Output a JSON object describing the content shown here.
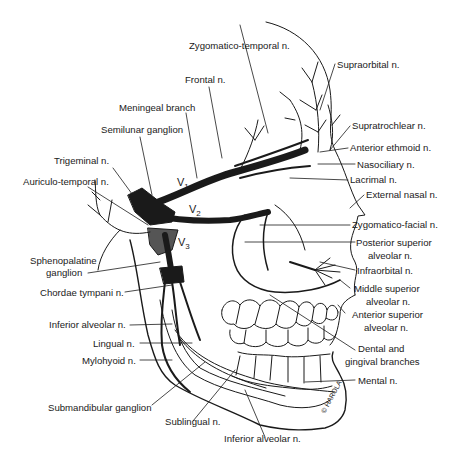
{
  "diagram": {
    "labels_left": [
      {
        "id": "zygomatico-temporal",
        "text": "Zygomatico-temporal n."
      },
      {
        "id": "frontal",
        "text": "Frontal n."
      },
      {
        "id": "meningeal",
        "text": "Meningeal branch"
      },
      {
        "id": "semilunar",
        "text": "Semilunar ganglion"
      },
      {
        "id": "trigeminal",
        "text": "Trigeminal n."
      },
      {
        "id": "auriculo-temporal",
        "text": "Auriculo-temporal n."
      },
      {
        "id": "sphenopalatine-1",
        "text": "Sphenopalatine"
      },
      {
        "id": "sphenopalatine-2",
        "text": "ganglion"
      },
      {
        "id": "chordae-tympani",
        "text": "Chordae tympani n."
      },
      {
        "id": "inferior-alveolar-left",
        "text": "Inferior alveolar n."
      },
      {
        "id": "lingual",
        "text": "Lingual n."
      },
      {
        "id": "mylohyoid",
        "text": "Mylohyoid n."
      },
      {
        "id": "submandibular",
        "text": "Submandibular ganglion"
      },
      {
        "id": "sublingual",
        "text": "Sublingual n."
      },
      {
        "id": "inferior-alveolar-bottom",
        "text": "Inferior alveolar n."
      }
    ],
    "labels_right": [
      {
        "id": "supraorbital",
        "text": "Supraorbital n."
      },
      {
        "id": "supratrochlear",
        "text": "Supratrochlear n."
      },
      {
        "id": "anterior-ethmoid",
        "text": "Anterior ethmoid n."
      },
      {
        "id": "nasociliary",
        "text": "Nasociliary n."
      },
      {
        "id": "lacrimal",
        "text": "Lacrimal n."
      },
      {
        "id": "external-nasal",
        "text": "External nasal n."
      },
      {
        "id": "zygomatico-facial",
        "text": "Zygomatico-facial n."
      },
      {
        "id": "posterior-superior-1",
        "text": "Posterior superior"
      },
      {
        "id": "posterior-superior-2",
        "text": "alveolar n."
      },
      {
        "id": "infraorbital",
        "text": "Infraorbital n."
      },
      {
        "id": "middle-superior-1",
        "text": "Middle superior"
      },
      {
        "id": "middle-superior-2",
        "text": "alveolar n."
      },
      {
        "id": "anterior-superior-1",
        "text": "Anterior superior"
      },
      {
        "id": "anterior-superior-2",
        "text": "alveolar n."
      },
      {
        "id": "dental-gingival-1",
        "text": "Dental and"
      },
      {
        "id": "dental-gingival-2",
        "text": "gingival branches"
      },
      {
        "id": "mental",
        "text": "Mental n."
      }
    ],
    "divisions": {
      "v1": "V",
      "v1_sub": "1",
      "v2": "V",
      "v2_sub": "2",
      "v3": "V",
      "v3_sub": "3"
    },
    "signature": "© HAROLA"
  }
}
